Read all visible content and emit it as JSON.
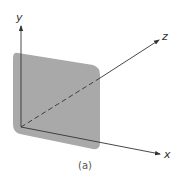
{
  "figure": {
    "caption": "(a)",
    "axes": {
      "x": {
        "label": "x"
      },
      "y": {
        "label": "y"
      },
      "z": {
        "label": "z"
      }
    },
    "plane": {
      "description": "shaded plane in x-y plane",
      "color": "#a9a9a9"
    },
    "colors": {
      "axis": "#333333",
      "plane": "#a9a9a9"
    }
  }
}
